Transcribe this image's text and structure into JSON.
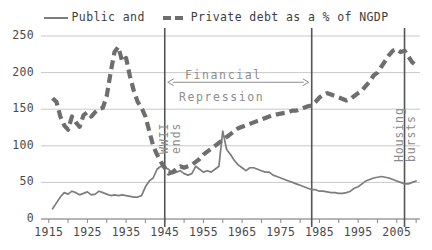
{
  "legend": {
    "entries": [
      {
        "label": "Public and",
        "style": "solid",
        "icon": "solid-line-swatch"
      },
      {
        "label": "Private debt as a % of NGDP",
        "style": "dashed",
        "icon": "dashed-line-swatch"
      }
    ]
  },
  "annotations": {
    "financial_line1": "Financial",
    "financial_line2": "Repression",
    "wwii_line1": "WWII",
    "wwii_line2": "ends",
    "housing_line1": "Housing",
    "housing_line2": "bursts"
  },
  "colors": {
    "public_series": "#7d7d7d",
    "private_series": "#6e6e6e",
    "grid": "#c9c9c9",
    "axis": "#888888",
    "marker_line": "#555555",
    "annotation_text": "#8c8c8c",
    "tick_text": "#4a4a4a"
  },
  "chart_data": {
    "type": "line",
    "title": "",
    "subtitle": "",
    "xlabel": "",
    "ylabel": "",
    "xlim": [
      1913,
      2011
    ],
    "ylim": [
      0,
      250
    ],
    "yticks": [
      0,
      50,
      100,
      150,
      200,
      250
    ],
    "xticks": [
      1915,
      1925,
      1935,
      1945,
      1955,
      1965,
      1975,
      1985,
      1995,
      2005
    ],
    "grid": true,
    "legend_position": "top",
    "markers": [
      {
        "x": 1945,
        "label": "WWII ends"
      },
      {
        "x": 1983,
        "label": ""
      },
      {
        "x": 2007,
        "label": "Housing bursts"
      }
    ],
    "span_annotations": [
      {
        "from": 1945,
        "to": 1983,
        "label": "Financial Repression",
        "y": 195
      }
    ],
    "series": [
      {
        "name": "Public debt as a % of NGDP",
        "style": "solid",
        "x": [
          1916,
          1917,
          1918,
          1919,
          1920,
          1921,
          1922,
          1923,
          1924,
          1925,
          1926,
          1927,
          1928,
          1929,
          1930,
          1931,
          1932,
          1933,
          1934,
          1935,
          1936,
          1937,
          1938,
          1939,
          1940,
          1941,
          1942,
          1943,
          1944,
          1945,
          1946,
          1947,
          1948,
          1949,
          1950,
          1951,
          1952,
          1953,
          1954,
          1955,
          1956,
          1957,
          1958,
          1959,
          1960,
          1961,
          1962,
          1963,
          1964,
          1965,
          1966,
          1967,
          1968,
          1969,
          1970,
          1971,
          1972,
          1973,
          1974,
          1975,
          1976,
          1977,
          1978,
          1979,
          1980,
          1981,
          1982,
          1983,
          1984,
          1985,
          1986,
          1987,
          1988,
          1989,
          1990,
          1991,
          1992,
          1993,
          1994,
          1995,
          1996,
          1997,
          1998,
          1999,
          2000,
          2001,
          2002,
          2003,
          2004,
          2005,
          2006,
          2007,
          2008,
          2009,
          2010
        ],
        "y": [
          14,
          22,
          30,
          36,
          34,
          38,
          36,
          33,
          35,
          37,
          33,
          34,
          38,
          36,
          34,
          32,
          33,
          32,
          33,
          32,
          31,
          30,
          30,
          32,
          44,
          52,
          56,
          68,
          72,
          70,
          68,
          62,
          64,
          66,
          62,
          60,
          62,
          72,
          68,
          64,
          66,
          64,
          68,
          72,
          120,
          95,
          88,
          80,
          74,
          70,
          66,
          70,
          70,
          68,
          66,
          64,
          64,
          60,
          58,
          56,
          54,
          52,
          50,
          48,
          46,
          44,
          42,
          40,
          40,
          38,
          38,
          37,
          36,
          36,
          35,
          35,
          36,
          38,
          42,
          44,
          48,
          52,
          54,
          56,
          57,
          58,
          57,
          56,
          54,
          52,
          50,
          48,
          48,
          50,
          52
        ],
        "note": "approximate values read from the plot"
      },
      {
        "name": "Private debt as a % of NGDP",
        "style": "dashed",
        "x": [
          1916,
          1917,
          1918,
          1919,
          1920,
          1921,
          1922,
          1923,
          1924,
          1925,
          1926,
          1927,
          1928,
          1929,
          1930,
          1931,
          1932,
          1933,
          1934,
          1935,
          1936,
          1937,
          1938,
          1939,
          1940,
          1941,
          1942,
          1943,
          1944,
          1945,
          1946,
          1947,
          1948,
          1949,
          1950,
          1951,
          1952,
          1953,
          1954,
          1955,
          1956,
          1957,
          1958,
          1959,
          1960,
          1961,
          1962,
          1963,
          1964,
          1965,
          1966,
          1967,
          1968,
          1969,
          1970,
          1971,
          1972,
          1973,
          1974,
          1975,
          1976,
          1977,
          1978,
          1979,
          1980,
          1981,
          1982,
          1983,
          1984,
          1985,
          1986,
          1987,
          1988,
          1989,
          1990,
          1991,
          1992,
          1993,
          1994,
          1995,
          1996,
          1997,
          1998,
          1999,
          2000,
          2001,
          2002,
          2003,
          2004,
          2005,
          2006,
          2007,
          2008,
          2009,
          2010
        ],
        "y": [
          165,
          160,
          140,
          128,
          122,
          140,
          132,
          126,
          142,
          146,
          140,
          146,
          150,
          152,
          168,
          200,
          228,
          235,
          215,
          220,
          195,
          175,
          160,
          152,
          140,
          120,
          100,
          88,
          78,
          70,
          62,
          64,
          68,
          72,
          70,
          72,
          74,
          78,
          82,
          88,
          92,
          96,
          100,
          104,
          108,
          112,
          116,
          120,
          124,
          126,
          128,
          130,
          132,
          134,
          136,
          138,
          140,
          142,
          143,
          144,
          145,
          146,
          148,
          148,
          150,
          152,
          154,
          155,
          160,
          166,
          170,
          172,
          170,
          168,
          166,
          164,
          162,
          164,
          168,
          172,
          176,
          182,
          188,
          196,
          200,
          208,
          216,
          224,
          230,
          232,
          228,
          230,
          222,
          214,
          210
        ],
        "note": "approximate values read from the plot"
      }
    ]
  }
}
